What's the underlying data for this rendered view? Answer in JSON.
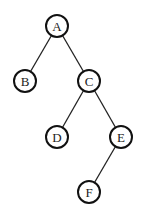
{
  "diagram": {
    "type": "binary-tree",
    "node_radius": 11,
    "colors": {
      "background": "#ffffff",
      "node_stroke": "#111111",
      "node_fill": "#ffffff",
      "edge": "#222222",
      "label": "#222222"
    },
    "nodes": [
      {
        "id": "A",
        "label": "A",
        "x": 57,
        "y": 26
      },
      {
        "id": "B",
        "label": "B",
        "x": 25,
        "y": 81
      },
      {
        "id": "C",
        "label": "C",
        "x": 89,
        "y": 81
      },
      {
        "id": "D",
        "label": "D",
        "x": 57,
        "y": 137
      },
      {
        "id": "E",
        "label": "E",
        "x": 121,
        "y": 137
      },
      {
        "id": "F",
        "label": "F",
        "x": 89,
        "y": 192
      }
    ],
    "edges": [
      {
        "from": "A",
        "to": "B"
      },
      {
        "from": "A",
        "to": "C"
      },
      {
        "from": "C",
        "to": "D"
      },
      {
        "from": "C",
        "to": "E"
      },
      {
        "from": "E",
        "to": "F"
      }
    ]
  }
}
